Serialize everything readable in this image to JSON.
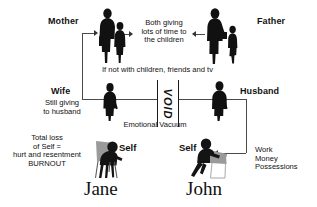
{
  "diagram": {
    "title_people": {
      "left": "Jane",
      "right": "John"
    },
    "roles": {
      "mother": "Mother",
      "father": "Father",
      "wife": "Wife",
      "husband": "Husband"
    },
    "notes": {
      "children": "Both giving\nlots of time to\nthe children",
      "if_not": "If not with children, friends and tv",
      "wife_giving": "Still giving\nto husband",
      "void": "VOID",
      "vacuum": "Emotional Vacuum",
      "jane_outcome": "Total loss\nof Self =\nhurt and resentment\nBURNOUT",
      "john_outcome": "Work\nMoney\nPossessions"
    },
    "self_labels": {
      "jane": "Self",
      "john": "Self"
    },
    "figures": {
      "mother_with_child": "mother-and-child-silhouette-icon",
      "father_with_child": "father-and-child-silhouette-icon",
      "wife_standing": "wife-silhouette-icon",
      "husband_standing": "husband-silhouette-icon",
      "jane_seated": "jane-seated-silhouette-icon",
      "john_seated": "john-seated-silhouette-icon"
    },
    "colors": {
      "background": "#ffffff",
      "silhouette": "#111111",
      "chair_gray": "#9a9a9a",
      "connector": "#4a4a4a",
      "text": "#111111"
    }
  }
}
